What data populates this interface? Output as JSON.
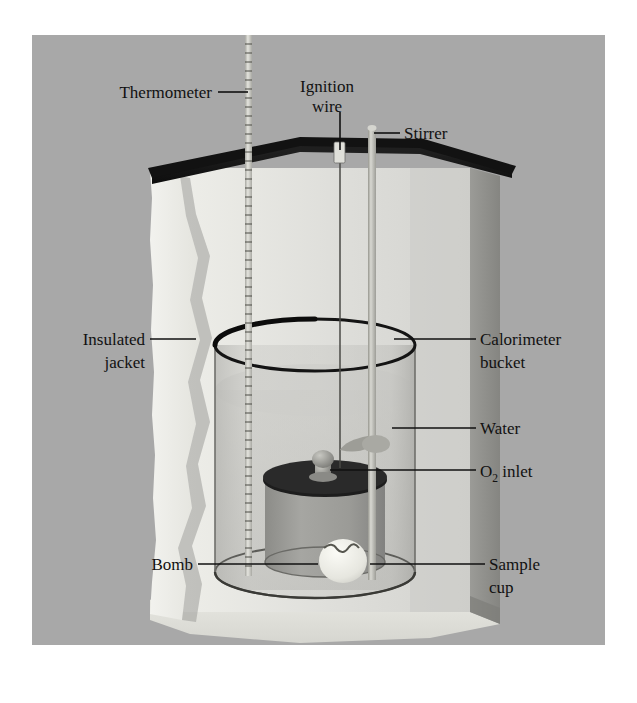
{
  "figure": {
    "canvas": {
      "width": 637,
      "height": 703
    },
    "panel": {
      "x": 32,
      "y": 35,
      "width": 573,
      "height": 610
    },
    "colors": {
      "page_background": "#ffffff",
      "panel_background": "#a8a8a8",
      "jacket_outer_wall": "#8e8e8e",
      "jacket_inner_face": "#d8d8d4",
      "jacket_cut_edge": "#ebebe6",
      "jacket_base": "#e2e2dc",
      "lid_dark": "#181818",
      "bucket_glass": "#b9b9b5",
      "water_tint": "#c6c6c2",
      "bomb_body": "#9a9a96",
      "bomb_lid": "#1d1d1d",
      "sample_cup": "#eeeee8",
      "stirrer_rod": "#bdbdb8",
      "thermometer": "#cfcfc9",
      "label_text": "#111111",
      "leader_line": "#111111"
    }
  },
  "labels": [
    {
      "id": "thermometer",
      "text": "Thermometer",
      "text2": "",
      "align": "end",
      "x": 212,
      "y": 98,
      "leader": "M 218 92 L 248 92"
    },
    {
      "id": "ignition-wire",
      "text": "Ignition",
      "text2": "wire",
      "align": "middle",
      "x": 327,
      "y": 92,
      "leader": "M 340 112 L 340 150"
    },
    {
      "id": "stirrer",
      "text": "Stirrer",
      "text2": "",
      "align": "start",
      "x": 404,
      "y": 139,
      "leader": "M 374 133 L 400 133"
    },
    {
      "id": "insulated-jacket",
      "text": "Insulated",
      "text2": "jacket",
      "align": "end",
      "x": 145,
      "y": 345,
      "leader": "M 150 339 L 196 339"
    },
    {
      "id": "calorimeter-bucket",
      "text": "Calorimeter",
      "text2": "bucket",
      "align": "start",
      "x": 480,
      "y": 345,
      "leader": "M 394 339 L 476 339"
    },
    {
      "id": "water",
      "text": "Water",
      "text2": "",
      "align": "start",
      "x": 480,
      "y": 434,
      "leader": "M 392 428 L 476 428"
    },
    {
      "id": "o2-inlet",
      "text": "O",
      "text2": "",
      "align": "start",
      "x": 480,
      "y": 477,
      "leader": "M 330 470 L 476 470",
      "sub": "2",
      "tail": " inlet"
    },
    {
      "id": "bomb",
      "text": "Bomb",
      "text2": "",
      "align": "end",
      "x": 193,
      "y": 570,
      "leader": "M 198 564 L 318 564"
    },
    {
      "id": "sample-cup",
      "text": "Sample",
      "text2": "cup",
      "align": "start",
      "x": 489,
      "y": 570,
      "leader": "M 370 564 L 485 564"
    }
  ],
  "parts": {
    "thermometer": {
      "name": "Thermometer",
      "x": 248,
      "top": 35,
      "bottom": 576,
      "graduations": 60
    },
    "ignition_wire": {
      "name": "Ignition wire",
      "x": 340,
      "top": 150,
      "bottom": 470
    },
    "stirrer": {
      "name": "Stirrer",
      "x": 372,
      "top": 128,
      "bottom": 580,
      "paddle_y": 444
    },
    "insulated_jacket": {
      "name": "Insulated jacket"
    },
    "calorimeter_bucket": {
      "name": "Calorimeter bucket",
      "left": 215,
      "right": 415,
      "rim_y": 345,
      "base_y": 585
    },
    "water": {
      "name": "Water",
      "surface_y": 390
    },
    "bomb": {
      "name": "Bomb",
      "left": 265,
      "right": 385,
      "lid_y": 472,
      "base_y": 580
    },
    "o2_inlet": {
      "name": "O2 inlet",
      "x": 322,
      "y": 462
    },
    "sample_cup": {
      "name": "Sample cup",
      "x": 343,
      "y": 562
    }
  }
}
